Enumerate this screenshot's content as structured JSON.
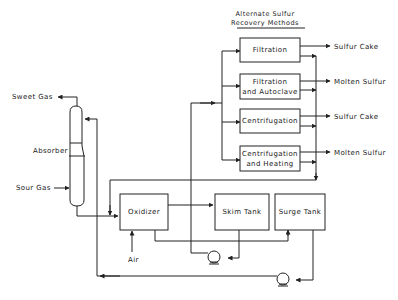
{
  "header": {
    "line1": "Alternate Sulfur",
    "line2": "Recovery Methods"
  },
  "methods": [
    {
      "line1": "Filtration",
      "line2": "",
      "output": "Sulfur Cake"
    },
    {
      "line1": "Filtration",
      "line2": "and Autoclave",
      "output": "Molten Sulfur"
    },
    {
      "line1": "Centrifugation",
      "line2": "",
      "output": "Sulfur Cake"
    },
    {
      "line1": "Centrifugation",
      "line2": "and Heating",
      "output": "Molten Sulfur"
    }
  ],
  "absorber": {
    "label": "Absorber",
    "sweet_gas": "Sweet Gas",
    "sour_gas": "Sour Gas"
  },
  "units": {
    "oxidizer": "Oxidizer",
    "skim_tank": "Skim Tank",
    "surge_tank": "Surge Tank",
    "air": "Air"
  }
}
